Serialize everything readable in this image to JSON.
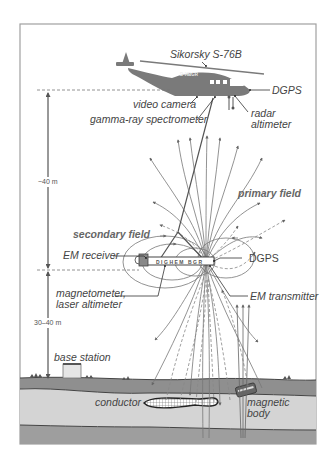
{
  "diagram": {
    "helicopter": {
      "model_label": "Sikorsky S-76B",
      "registration": "D-HBGR"
    },
    "labels": {
      "sikorsky": "Sikorsky S-76B",
      "dgps_heli": "DGPS",
      "video_camera": "video camera",
      "gamma_ray": "gamma-ray spectrometer",
      "radar_altimeter_1": "radar",
      "radar_altimeter_2": "altimeter",
      "primary_field": "primary field",
      "secondary_field": "secondary field",
      "em_receiver": "EM receiver",
      "dgps_bird": "DGPS",
      "magnetometer_1": "magnetometer,",
      "magnetometer_2": "laser altimeter",
      "em_transmitter": "EM transmitter",
      "base_station": "base station",
      "conductor": "conductor",
      "magnetic_body_1": "magnetic",
      "magnetic_body_2": "body",
      "bird_text": "DIGHEM  BGR"
    },
    "dimensions": {
      "upper_height": "~40 m",
      "lower_height": "30–40 m"
    },
    "colors": {
      "helicopter": "#7a7a7a",
      "line": "#555555",
      "ground_dark": "#8f8f8f",
      "ground_light": "#d4d4d4",
      "frame": "#a0a0a0"
    }
  }
}
